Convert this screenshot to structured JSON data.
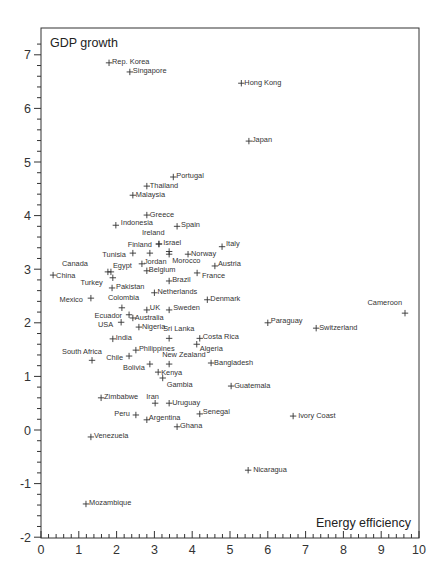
{
  "chart_data": {
    "type": "scatter",
    "title": "",
    "xlabel": "Energy efficiency",
    "ylabel": "GDP growth",
    "xlim": [
      0,
      10
    ],
    "ylim": [
      -2,
      7.3
    ],
    "x_ticks": [
      0,
      1,
      2,
      3,
      4,
      5,
      6,
      7,
      8,
      9,
      10
    ],
    "y_ticks": [
      -2,
      -1,
      0,
      1,
      2,
      3,
      4,
      5,
      6,
      7
    ],
    "minor_tick_step": 0.2,
    "grid": false,
    "legend": null,
    "marker": "+",
    "points": [
      {
        "label": "Rep. Korea",
        "x": 1.8,
        "y": 6.85,
        "lx": 3,
        "ly": -1
      },
      {
        "label": "Singapore",
        "x": 2.35,
        "y": 6.68,
        "lx": 3,
        "ly": -1
      },
      {
        "label": "Hong Kong",
        "x": 5.3,
        "y": 6.47,
        "lx": 3,
        "ly": -1
      },
      {
        "label": "Japan",
        "x": 5.5,
        "y": 5.39,
        "lx": 3,
        "ly": -2
      },
      {
        "label": "Portugal",
        "x": 3.5,
        "y": 4.72,
        "lx": 3,
        "ly": -2
      },
      {
        "label": "Thailand",
        "x": 2.8,
        "y": 4.55,
        "lx": 3,
        "ly": -1
      },
      {
        "label": "Malaysia",
        "x": 2.43,
        "y": 4.38,
        "lx": 3,
        "ly": -1
      },
      {
        "label": "Greece",
        "x": 2.8,
        "y": 4.01,
        "lx": 3,
        "ly": -1
      },
      {
        "label": "Indonesia",
        "x": 1.98,
        "y": 3.82,
        "lx": 5,
        "ly": -3
      },
      {
        "label": "Spain",
        "x": 3.6,
        "y": 3.8,
        "lx": 4,
        "ly": -2
      },
      {
        "label": "Ireland",
        "x": 3.12,
        "y": 3.47,
        "lx": -17,
        "ly": -12,
        "anchor": "start"
      },
      {
        "label": "Finland",
        "x": 3.12,
        "y": 3.47,
        "lx": -7,
        "ly": 0,
        "anchor": "end"
      },
      {
        "label": "Israel",
        "x": 3.39,
        "y": 3.33,
        "lx": -6,
        "ly": -9,
        "anchor": "start"
      },
      {
        "label": "Tunisia",
        "x": 2.43,
        "y": 3.3,
        "lx": -7,
        "ly": 1,
        "anchor": "end"
      },
      {
        "label": "",
        "x": 2.88,
        "y": 3.3,
        "lx": 0,
        "ly": 0
      },
      {
        "label": "Morocco",
        "x": 3.39,
        "y": 3.28,
        "lx": 3,
        "ly": 6
      },
      {
        "label": "Norway",
        "x": 3.89,
        "y": 3.28,
        "lx": 3,
        "ly": -1
      },
      {
        "label": "Italy",
        "x": 4.79,
        "y": 3.42,
        "lx": 4,
        "ly": -3
      },
      {
        "label": "Jordan",
        "x": 2.67,
        "y": 3.1,
        "lx": 2,
        "ly": -2
      },
      {
        "label": "Belgium",
        "x": 2.8,
        "y": 2.97,
        "lx": 2,
        "ly": -1
      },
      {
        "label": "Austria",
        "x": 4.6,
        "y": 3.06,
        "lx": 3,
        "ly": -2
      },
      {
        "label": "Canada",
        "x": 1.77,
        "y": 2.95,
        "lx": -20,
        "ly": -8,
        "anchor": "end"
      },
      {
        "label": "Egypt",
        "x": 1.85,
        "y": 2.95,
        "lx": 2,
        "ly": -6
      },
      {
        "label": "Turkey",
        "x": 1.9,
        "y": 2.84,
        "lx": -10,
        "ly": 5,
        "anchor": "end"
      },
      {
        "label": "China",
        "x": 0.32,
        "y": 2.89,
        "lx": 3,
        "ly": 0
      },
      {
        "label": "France",
        "x": 4.13,
        "y": 2.93,
        "lx": 5,
        "ly": 3
      },
      {
        "label": "Brazil",
        "x": 3.39,
        "y": 2.78,
        "lx": 3,
        "ly": -1
      },
      {
        "label": "Pakistan",
        "x": 1.88,
        "y": 2.65,
        "lx": 4,
        "ly": -1
      },
      {
        "label": "Netherlands",
        "x": 3.0,
        "y": 2.56,
        "lx": 3,
        "ly": -1
      },
      {
        "label": "Mexico",
        "x": 1.32,
        "y": 2.46,
        "lx": -8,
        "ly": 1,
        "anchor": "end"
      },
      {
        "label": "Denmark",
        "x": 4.4,
        "y": 2.43,
        "lx": 3,
        "ly": -1
      },
      {
        "label": "Colombia",
        "x": 2.14,
        "y": 2.28,
        "lx": -14,
        "ly": -10
      },
      {
        "label": "UK",
        "x": 2.8,
        "y": 2.24,
        "lx": 3,
        "ly": -2
      },
      {
        "label": "Sweden",
        "x": 3.39,
        "y": 2.24,
        "lx": 4,
        "ly": -2
      },
      {
        "label": "Ecuador",
        "x": 2.33,
        "y": 2.15,
        "lx": -7,
        "ly": 1,
        "anchor": "end"
      },
      {
        "label": "Australia",
        "x": 2.43,
        "y": 2.09,
        "lx": 2,
        "ly": 0
      },
      {
        "label": "USA",
        "x": 2.12,
        "y": 2.01,
        "lx": -8,
        "ly": 2,
        "anchor": "end"
      },
      {
        "label": "Nigeria",
        "x": 2.59,
        "y": 1.92,
        "lx": 3,
        "ly": -1
      },
      {
        "label": "Paraguay",
        "x": 6.0,
        "y": 2.0,
        "lx": 3,
        "ly": -2
      },
      {
        "label": "Cameroon",
        "x": 9.63,
        "y": 2.18,
        "lx": -3,
        "ly": -11,
        "anchor": "end"
      },
      {
        "label": "Switzerland",
        "x": 7.28,
        "y": 1.9,
        "lx": 3,
        "ly": -1
      },
      {
        "label": "India",
        "x": 1.9,
        "y": 1.7,
        "lx": 3,
        "ly": -1
      },
      {
        "label": "Sri Lanka",
        "x": 3.39,
        "y": 1.71,
        "lx": -6,
        "ly": -10
      },
      {
        "label": "Costa Rica",
        "x": 4.2,
        "y": 1.71,
        "lx": 3,
        "ly": -2
      },
      {
        "label": "Algeria",
        "x": 4.12,
        "y": 1.6,
        "lx": 3,
        "ly": 4
      },
      {
        "label": "Philippines",
        "x": 2.51,
        "y": 1.49,
        "lx": 3,
        "ly": -2
      },
      {
        "label": "South Africa",
        "x": 1.35,
        "y": 1.3,
        "lx": -30,
        "ly": -9
      },
      {
        "label": "Chile",
        "x": 2.33,
        "y": 1.38,
        "lx": -6,
        "ly": 1,
        "anchor": "end"
      },
      {
        "label": "New Zealand",
        "x": 3.39,
        "y": 1.23,
        "lx": -7,
        "ly": -10
      },
      {
        "label": "Bangladesh",
        "x": 4.5,
        "y": 1.25,
        "lx": 3,
        "ly": -1
      },
      {
        "label": "Bolivia",
        "x": 2.88,
        "y": 1.23,
        "lx": -5,
        "ly": 3,
        "anchor": "end"
      },
      {
        "label": "Kenya",
        "x": 3.1,
        "y": 1.08,
        "lx": 3,
        "ly": 0
      },
      {
        "label": "Gambia",
        "x": 3.22,
        "y": 0.97,
        "lx": 4,
        "ly": 6
      },
      {
        "label": "Guatemala",
        "x": 5.03,
        "y": 0.82,
        "lx": 3,
        "ly": -1
      },
      {
        "label": "Zimbabwe",
        "x": 1.59,
        "y": 0.6,
        "lx": 3,
        "ly": -1
      },
      {
        "label": "Iran",
        "x": 3.02,
        "y": 0.5,
        "lx": -9,
        "ly": -7
      },
      {
        "label": "Uruguay",
        "x": 3.39,
        "y": 0.5,
        "lx": 3,
        "ly": -1
      },
      {
        "label": "Peru",
        "x": 2.51,
        "y": 0.28,
        "lx": -6,
        "ly": -1,
        "anchor": "end"
      },
      {
        "label": "Senegal",
        "x": 4.2,
        "y": 0.3,
        "lx": 3,
        "ly": -2
      },
      {
        "label": "Ivory Coast",
        "x": 6.67,
        "y": 0.26,
        "lx": 5,
        "ly": -1
      },
      {
        "label": "Argentina",
        "x": 2.8,
        "y": 0.19,
        "lx": 2,
        "ly": -2
      },
      {
        "label": "Ghana",
        "x": 3.6,
        "y": 0.06,
        "lx": 3,
        "ly": -1
      },
      {
        "label": "Venezuela",
        "x": 1.32,
        "y": -0.13,
        "lx": 3,
        "ly": -1
      },
      {
        "label": "Nicaragua",
        "x": 5.48,
        "y": -0.75,
        "lx": 5,
        "ly": -1
      },
      {
        "label": "Mozambique",
        "x": 1.19,
        "y": -1.38,
        "lx": 3,
        "ly": -1
      }
    ]
  },
  "styles": {
    "ink_color": "#333333",
    "background": "#ffffff"
  },
  "layout": {
    "plot_left": 41,
    "plot_right": 419,
    "plot_top": 28,
    "plot_bottom": 538,
    "x_px_per_unit": 37.8,
    "y_zero_px": 430,
    "y_px_per_unit": 53.6
  }
}
